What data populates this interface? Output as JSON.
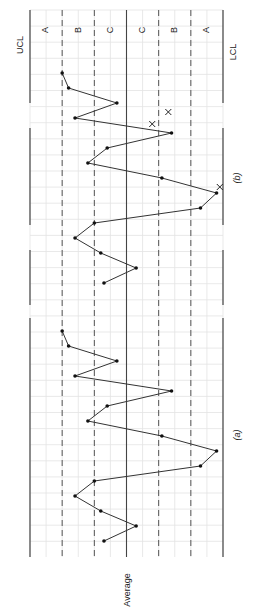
{
  "chart_data": {
    "type": "line",
    "orientation": "rotated-90-ccw",
    "xlabel": "",
    "ylabel": "Average",
    "axis_labels": {
      "ucl": "UCL",
      "lcl": "LCL",
      "center": "Average"
    },
    "zones": [
      "A",
      "B",
      "C",
      "C",
      "B",
      "A"
    ],
    "zone_scale": {
      "ucl": 3,
      "lcl": -3,
      "center": 0,
      "ylim": [
        -3,
        3
      ]
    },
    "grid": true,
    "panels": [
      {
        "label": "(a)",
        "x": [
          1,
          2,
          3,
          4,
          5,
          6,
          7,
          8,
          9,
          10,
          11,
          12,
          13,
          14,
          15
        ],
        "values": [
          2.0,
          1.8,
          0.3,
          1.6,
          -1.4,
          0.6,
          1.2,
          -1.1,
          -2.8,
          -2.3,
          1.0,
          1.6,
          0.8,
          -0.3,
          0.7
        ],
        "markers": []
      },
      {
        "label": "(b)",
        "x": [
          1,
          2,
          3,
          4,
          5,
          6,
          7,
          8,
          9,
          10,
          11,
          12,
          13,
          14,
          15
        ],
        "values": [
          2.0,
          1.8,
          0.3,
          1.6,
          -1.4,
          0.6,
          1.2,
          -1.1,
          -2.8,
          -2.3,
          1.0,
          1.6,
          0.8,
          -0.3,
          0.7
        ],
        "markers": [
          {
            "symbol": "x",
            "x": 3.6,
            "value": -1.3
          },
          {
            "symbol": "x",
            "x": 4.4,
            "value": -0.8
          },
          {
            "symbol": "x",
            "x": 8.6,
            "value": -2.9
          }
        ]
      }
    ]
  }
}
